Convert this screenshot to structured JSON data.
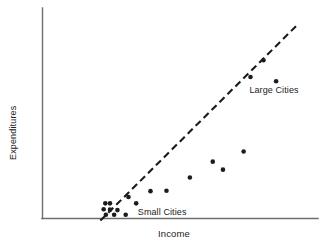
{
  "chart_data": {
    "type": "scatter",
    "title": "",
    "xlabel": "Income",
    "ylabel": "Expenditures",
    "grid": false,
    "legend_position": "inline-annotations",
    "axis_style": "L-shaped, no tick marks, no tick labels",
    "xlim": [
      0,
      10
    ],
    "ylim": [
      0,
      10
    ],
    "points": [
      {
        "x": 2.28,
        "y": 0.72
      },
      {
        "x": 2.45,
        "y": 0.72
      },
      {
        "x": 2.22,
        "y": 0.44
      },
      {
        "x": 2.45,
        "y": 0.42
      },
      {
        "x": 2.72,
        "y": 0.4
      },
      {
        "x": 2.3,
        "y": 0.18
      },
      {
        "x": 2.6,
        "y": 0.18
      },
      {
        "x": 3.02,
        "y": 0.18
      },
      {
        "x": 3.12,
        "y": 1.02
      },
      {
        "x": 3.4,
        "y": 0.72
      },
      {
        "x": 3.92,
        "y": 1.3
      },
      {
        "x": 4.5,
        "y": 1.32
      },
      {
        "x": 5.35,
        "y": 1.95
      },
      {
        "x": 6.18,
        "y": 2.7
      },
      {
        "x": 6.55,
        "y": 2.32
      },
      {
        "x": 7.3,
        "y": 3.18
      },
      {
        "x": 7.55,
        "y": 6.72
      },
      {
        "x": 8.02,
        "y": 7.52
      },
      {
        "x": 8.48,
        "y": 6.52
      }
    ],
    "trend_line": {
      "style": "dashed",
      "x_start": 2.1,
      "y_start": -0.1,
      "x_end": 9.25,
      "y_end": 9.2
    },
    "annotations": [
      {
        "id": "small-cities",
        "text": "Small Cities",
        "x": 3.35,
        "y": 0.28
      },
      {
        "id": "large-cities",
        "text": "Large Cities",
        "x": 7.4,
        "y": 6.05
      }
    ]
  },
  "colors": {
    "background": "#ffffff",
    "axis": "#6e6e6e",
    "point": "#1c1c1c",
    "trend": "#1a1a1a",
    "text": "#222222"
  }
}
